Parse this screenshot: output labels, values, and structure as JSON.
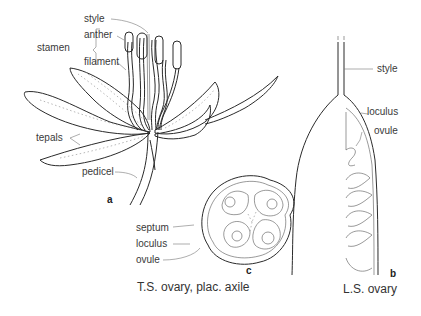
{
  "figure": {
    "panel_a": {
      "id": "a",
      "labels": {
        "style": "style",
        "stamen": "stamen",
        "anther": "anther",
        "filament": "filament",
        "tepals": "tepals",
        "pedicel": "pedicel"
      }
    },
    "panel_b": {
      "id": "b",
      "caption": "L.S. ovary",
      "labels": {
        "style": "style",
        "loculus": "loculus",
        "ovule": "ovule"
      }
    },
    "panel_c": {
      "id": "c",
      "caption": "T.S. ovary, plac. axile",
      "labels": {
        "septum": "septum",
        "loculus": "loculus",
        "ovule": "ovule"
      }
    }
  }
}
